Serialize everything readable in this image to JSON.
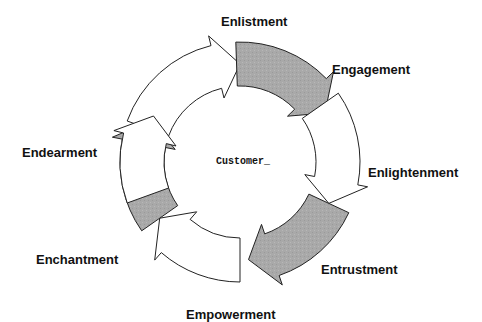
{
  "diagram": {
    "center": {
      "label": "Customer_",
      "x": 240,
      "y": 162
    },
    "geometry": {
      "outer_radius": 120,
      "inner_radius": 76
    },
    "colors": {
      "gray_fill": "#a9a9a9",
      "white_fill": "#ffffff",
      "stroke": "#222222",
      "text": "#111111"
    },
    "arrows": [
      {
        "name": "enlistment",
        "fill": "white",
        "start_deg": 200,
        "end_deg": 270
      },
      {
        "name": "engagement",
        "fill": "gray",
        "start_deg": 268,
        "end_deg": 330
      },
      {
        "name": "enlightenment",
        "fill": "white",
        "start_deg": 325,
        "end_deg": 385
      },
      {
        "name": "entrustment",
        "fill": "gray",
        "start_deg": 385,
        "end_deg": 445
      },
      {
        "name": "empowerment",
        "fill": "white",
        "start_deg": 450,
        "end_deg": 505
      },
      {
        "name": "enchantment",
        "fill": "gray",
        "start_deg": 505,
        "end_deg": 565
      },
      {
        "name": "endearment",
        "fill": "white",
        "start_deg": 160,
        "end_deg": 208
      }
    ],
    "stages": [
      {
        "label": "Enlistment",
        "x": 221,
        "y": 14
      },
      {
        "label": "Engagement",
        "x": 332,
        "y": 62
      },
      {
        "label": "Enlightenment",
        "x": 368,
        "y": 165
      },
      {
        "label": "Entrustment",
        "x": 321,
        "y": 262
      },
      {
        "label": "Empowerment",
        "x": 186,
        "y": 307
      },
      {
        "label": "Enchantment",
        "x": 36,
        "y": 252
      },
      {
        "label": "Endearment",
        "x": 22,
        "y": 145
      }
    ]
  }
}
